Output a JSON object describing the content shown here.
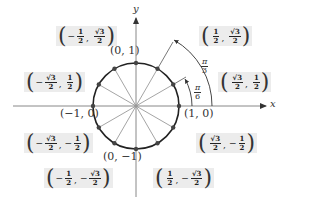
{
  "diagram": {
    "colors": {
      "circle": "#222222",
      "spokes": "#9a9a9a",
      "axes": "#888888",
      "box_bg": "#ececec",
      "point": "#444444"
    },
    "axes": {
      "x_label": "x",
      "y_label": "y"
    },
    "center": {
      "cx": 136,
      "cy": 106,
      "r": 43
    },
    "axis_points": [
      {
        "id": "top",
        "label": "(0, 1)"
      },
      {
        "id": "left",
        "label": "(−1, 0)"
      },
      {
        "id": "right",
        "label": "(1, 0)"
      },
      {
        "id": "bottom",
        "label": "(0, −1)"
      }
    ],
    "angle_labels": [
      {
        "id": "pi-3",
        "num": "π",
        "den": "3"
      },
      {
        "id": "pi-6",
        "num": "π",
        "den": "6"
      }
    ],
    "coordinate_boxes": [
      {
        "id": "q2-120",
        "x_sign": "−",
        "x_num": "1",
        "x_den": "2",
        "y_sign": "",
        "y_num": "√3",
        "y_den": "2"
      },
      {
        "id": "q1-60",
        "x_sign": "",
        "x_num": "1",
        "x_den": "2",
        "y_sign": "",
        "y_num": "√3",
        "y_den": "2"
      },
      {
        "id": "q2-150",
        "x_sign": "−",
        "x_num": "√3",
        "x_den": "2",
        "y_sign": "",
        "y_num": "1",
        "y_den": "2"
      },
      {
        "id": "q1-30",
        "x_sign": "",
        "x_num": "√3",
        "x_den": "2",
        "y_sign": "",
        "y_num": "1",
        "y_den": "2"
      },
      {
        "id": "q3-210",
        "x_sign": "−",
        "x_num": "√3",
        "x_den": "2",
        "y_sign": "−",
        "y_num": "1",
        "y_den": "2"
      },
      {
        "id": "q4-330",
        "x_sign": "",
        "x_num": "√3",
        "x_den": "2",
        "y_sign": "−",
        "y_num": "1",
        "y_den": "2"
      },
      {
        "id": "q3-240",
        "x_sign": "−",
        "x_num": "1",
        "x_den": "2",
        "y_sign": "−",
        "y_num": "√3",
        "y_den": "2"
      },
      {
        "id": "q4-300",
        "x_sign": "",
        "x_num": "1",
        "x_den": "2",
        "y_sign": "−",
        "y_num": "√3",
        "y_den": "2"
      }
    ]
  }
}
